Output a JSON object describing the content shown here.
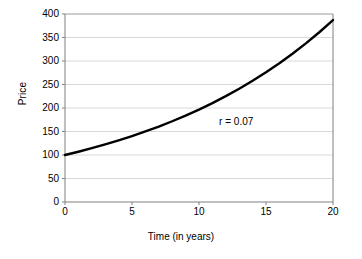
{
  "chart_data": {
    "type": "line",
    "title": "",
    "xlabel": "Time (in years)",
    "ylabel": "Price",
    "xlim": [
      0,
      20
    ],
    "ylim": [
      0,
      400
    ],
    "grid": "horizontal",
    "legend": "none",
    "annotations": [
      {
        "text": "r = 0.07",
        "x": 11.5,
        "y": 172
      }
    ],
    "x_ticks": [
      {
        "value": 0,
        "label": "0"
      },
      {
        "value": 5,
        "label": "5"
      },
      {
        "value": 10,
        "label": "10"
      },
      {
        "value": 15,
        "label": "15"
      },
      {
        "value": 20,
        "label": "20"
      }
    ],
    "y_ticks": [
      {
        "value": 0,
        "label": "0"
      },
      {
        "value": 50,
        "label": "50"
      },
      {
        "value": 100,
        "label": "100"
      },
      {
        "value": 150,
        "label": "150"
      },
      {
        "value": 200,
        "label": "200"
      },
      {
        "value": 250,
        "label": "250"
      },
      {
        "value": 300,
        "label": "300"
      },
      {
        "value": 350,
        "label": "350"
      },
      {
        "value": 400,
        "label": "400"
      }
    ],
    "series": [
      {
        "name": "Price",
        "color": "#000000",
        "x": [
          0,
          1,
          2,
          3,
          4,
          5,
          6,
          7,
          8,
          9,
          10,
          11,
          12,
          13,
          14,
          15,
          16,
          17,
          18,
          19,
          20
        ],
        "values": [
          100,
          107,
          114.5,
          122.5,
          131.1,
          140.3,
          150.1,
          160.6,
          171.8,
          183.8,
          196.7,
          210.5,
          225.2,
          241.0,
          257.9,
          275.9,
          295.2,
          315.9,
          338.0,
          361.7,
          387.0
        ]
      }
    ]
  },
  "colors": {
    "series_line": "#000000",
    "gridline": "#d9d9d9",
    "axis_line": "#808080",
    "plot_background": "#ffffff",
    "text": "#000000"
  }
}
